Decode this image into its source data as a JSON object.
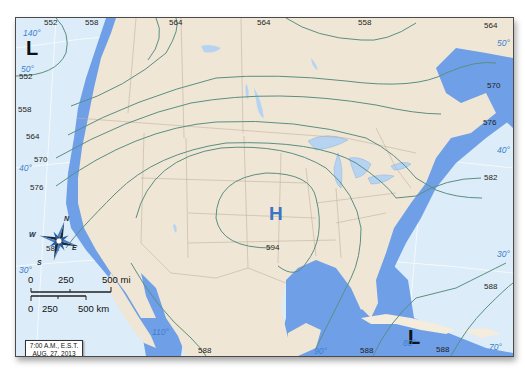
{
  "map": {
    "title": "500 mb height contours, North America",
    "pressure_systems": [
      {
        "id": "L-pacific",
        "symbol": "L",
        "color": "#111111"
      },
      {
        "id": "H-central",
        "symbol": "H",
        "color": "#3a74c4"
      },
      {
        "id": "L-caribbean",
        "symbol": "L",
        "color": "#111111"
      }
    ],
    "contour_labels": [
      {
        "id": "c552-top",
        "value": "552"
      },
      {
        "id": "c558-top",
        "value": "558"
      },
      {
        "id": "c564-top-left",
        "value": "564"
      },
      {
        "id": "c564-top-mid",
        "value": "564"
      },
      {
        "id": "c558-top-right",
        "value": "558"
      },
      {
        "id": "c564-top-right",
        "value": "564"
      },
      {
        "id": "c552-left",
        "value": "552"
      },
      {
        "id": "c558-left",
        "value": "558"
      },
      {
        "id": "c564-left",
        "value": "564"
      },
      {
        "id": "c570-left",
        "value": "570"
      },
      {
        "id": "c576-left",
        "value": "576"
      },
      {
        "id": "c582-left",
        "value": "582"
      },
      {
        "id": "c594-center",
        "value": "594"
      },
      {
        "id": "c570-right",
        "value": "570"
      },
      {
        "id": "c576-right",
        "value": "576"
      },
      {
        "id": "c582-right",
        "value": "582"
      },
      {
        "id": "c588-right",
        "value": "588"
      },
      {
        "id": "c588-bottom-mid",
        "value": "588"
      },
      {
        "id": "c588-bottom-right",
        "value": "588"
      },
      {
        "id": "c588-bottom-far",
        "value": "588"
      }
    ],
    "graticule_labels": [
      {
        "id": "lon140",
        "value": "140°"
      },
      {
        "id": "lat50-left",
        "value": "50°"
      },
      {
        "id": "lat40-left",
        "value": "40°"
      },
      {
        "id": "lat30-left",
        "value": "30°"
      },
      {
        "id": "lon110",
        "value": "110°"
      },
      {
        "id": "lon90",
        "value": "90°"
      },
      {
        "id": "lon80",
        "value": "80°"
      },
      {
        "id": "lon70",
        "value": "70°"
      },
      {
        "id": "lat50-right",
        "value": "50°"
      },
      {
        "id": "lat40-right",
        "value": "40°"
      },
      {
        "id": "lat30-right",
        "value": "30°"
      }
    ],
    "compass": {
      "n": "N",
      "s": "S",
      "e": "E",
      "w": "W"
    },
    "scale_bar": {
      "miles": {
        "t0": "0",
        "t1": "250",
        "t2": "500 mi"
      },
      "km": {
        "t0": "0",
        "t1": "250",
        "t2": "500 km"
      }
    },
    "timestamp": {
      "line1": "7:00 A.M., E.S.T.",
      "line2": "AUG. 27, 2013"
    },
    "colors": {
      "ocean": "#dcecf8",
      "shelf": "#6f9fe6",
      "land": "#efe6d6",
      "contour": "#5a8f82",
      "border": "#b8a898",
      "graticule": "#ffffff",
      "lat_label": "#3d7fd0",
      "high": "#3a74c4"
    }
  }
}
